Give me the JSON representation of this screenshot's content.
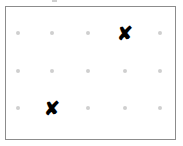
{
  "figure": {
    "background_color": "#ffffff",
    "width": 183,
    "height": 146
  },
  "frame": {
    "label": "plot border",
    "x": 5,
    "y": 6,
    "width": 171,
    "height": 134,
    "border_color": "#8c8c8c",
    "border_width": 1,
    "fill_color": "#ffffff"
  },
  "grid": {
    "label": "dot grid",
    "columns": 5,
    "rows": 3,
    "column_x": [
      18,
      52,
      88,
      125,
      160
    ],
    "row_y": [
      33,
      71,
      108
    ],
    "dot_color": "#cfcfcf",
    "dot_size": 4,
    "column_labels": [
      "1",
      "2",
      "3",
      "4",
      "5"
    ],
    "row_labels": [
      "1",
      "2",
      "3"
    ],
    "dots": [
      {
        "row": 0,
        "col": 0,
        "x": 18,
        "y": 33,
        "state": "empty"
      },
      {
        "row": 0,
        "col": 1,
        "x": 52,
        "y": 33,
        "state": "empty"
      },
      {
        "row": 0,
        "col": 2,
        "x": 88,
        "y": 33,
        "state": "empty"
      },
      {
        "row": 0,
        "col": 3,
        "x": 125,
        "y": 33,
        "state": "marked"
      },
      {
        "row": 0,
        "col": 4,
        "x": 160,
        "y": 33,
        "state": "empty"
      },
      {
        "row": 1,
        "col": 0,
        "x": 18,
        "y": 71,
        "state": "empty"
      },
      {
        "row": 1,
        "col": 1,
        "x": 52,
        "y": 71,
        "state": "empty"
      },
      {
        "row": 1,
        "col": 2,
        "x": 88,
        "y": 71,
        "state": "empty"
      },
      {
        "row": 1,
        "col": 3,
        "x": 125,
        "y": 71,
        "state": "empty"
      },
      {
        "row": 1,
        "col": 4,
        "x": 160,
        "y": 71,
        "state": "empty"
      },
      {
        "row": 2,
        "col": 0,
        "x": 18,
        "y": 108,
        "state": "empty"
      },
      {
        "row": 2,
        "col": 1,
        "x": 52,
        "y": 108,
        "state": "marked"
      },
      {
        "row": 2,
        "col": 2,
        "x": 88,
        "y": 108,
        "state": "empty"
      },
      {
        "row": 2,
        "col": 3,
        "x": 125,
        "y": 108,
        "state": "empty"
      },
      {
        "row": 2,
        "col": 4,
        "x": 160,
        "y": 108,
        "state": "empty"
      }
    ]
  },
  "markers": {
    "glyph": "✘",
    "color": "#000000",
    "font_size": 19,
    "count": 2,
    "items": [
      {
        "name": "marker-top-right",
        "row": 0,
        "col": 3,
        "x": 125,
        "y": 33,
        "glyph": "✘"
      },
      {
        "name": "marker-bottom-left",
        "row": 2,
        "col": 1,
        "x": 52,
        "y": 108,
        "glyph": "✘"
      }
    ]
  },
  "artifact": {
    "label": "scan artifact",
    "x": 52,
    "y": 0,
    "width": 5,
    "height": 2,
    "color": "#a8a8a8"
  },
  "chart_data": {
    "type": "scatter",
    "xlabel": "",
    "ylabel": "",
    "categories": [
      "1",
      "2",
      "3",
      "4",
      "5"
    ],
    "row_categories": [
      "1",
      "2",
      "3"
    ],
    "xlim": [
      0,
      6
    ],
    "ylim": [
      0,
      4
    ],
    "grid": true,
    "legend": false,
    "series": [
      {
        "name": "grid points",
        "marker": "dot",
        "color": "#cfcfcf",
        "points": [
          {
            "x": 1,
            "y": 3
          },
          {
            "x": 2,
            "y": 3
          },
          {
            "x": 3,
            "y": 3
          },
          {
            "x": 5,
            "y": 3
          },
          {
            "x": 1,
            "y": 2
          },
          {
            "x": 2,
            "y": 2
          },
          {
            "x": 3,
            "y": 2
          },
          {
            "x": 4,
            "y": 2
          },
          {
            "x": 5,
            "y": 2
          },
          {
            "x": 1,
            "y": 1
          },
          {
            "x": 3,
            "y": 1
          },
          {
            "x": 4,
            "y": 1
          },
          {
            "x": 5,
            "y": 1
          }
        ]
      },
      {
        "name": "marked points",
        "marker": "x",
        "color": "#000000",
        "points": [
          {
            "x": 4,
            "y": 3
          },
          {
            "x": 2,
            "y": 1
          }
        ]
      }
    ]
  }
}
